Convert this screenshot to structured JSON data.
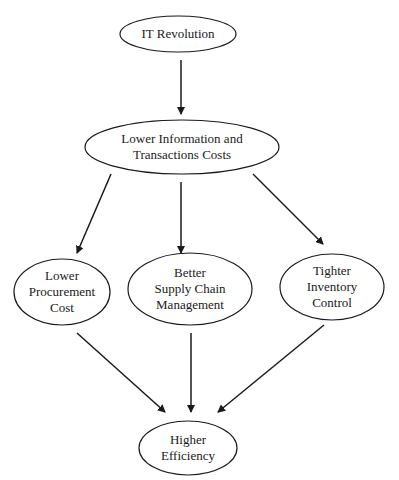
{
  "diagram": {
    "type": "flowchart",
    "stroke_color": "#1a1a1a",
    "background": "#ffffff",
    "nodes": [
      {
        "id": "it-revolution",
        "lines": [
          "IT Revolution"
        ],
        "cx": 178,
        "cy": 34,
        "rx": 58,
        "ry": 18
      },
      {
        "id": "lower-info-costs",
        "lines": [
          "Lower Information and",
          "Transactions Costs"
        ],
        "cx": 182,
        "cy": 147,
        "rx": 97,
        "ry": 27
      },
      {
        "id": "lower-procurement",
        "lines": [
          "Lower",
          "Procurement",
          "Cost"
        ],
        "cx": 62,
        "cy": 292,
        "rx": 48,
        "ry": 33
      },
      {
        "id": "better-supply-chain",
        "lines": [
          "Better",
          "Supply Chain",
          "Management"
        ],
        "cx": 190,
        "cy": 289,
        "rx": 62,
        "ry": 36
      },
      {
        "id": "tighter-inventory",
        "lines": [
          "Tighter",
          "Inventory",
          "Control"
        ],
        "cx": 332,
        "cy": 287,
        "rx": 52,
        "ry": 33
      },
      {
        "id": "higher-efficiency",
        "lines": [
          "Higher",
          "Efficiency"
        ],
        "cx": 188,
        "cy": 448,
        "rx": 49,
        "ry": 27
      }
    ],
    "edges": [
      {
        "from": "it-revolution",
        "to": "lower-info-costs",
        "x1": 181,
        "y1": 60,
        "x2": 181,
        "y2": 114
      },
      {
        "from": "lower-info-costs",
        "to": "lower-procurement",
        "x1": 111,
        "y1": 174,
        "x2": 77,
        "y2": 253
      },
      {
        "from": "lower-info-costs",
        "to": "better-supply-chain",
        "x1": 181,
        "y1": 182,
        "x2": 181,
        "y2": 253
      },
      {
        "from": "lower-info-costs",
        "to": "tighter-inventory",
        "x1": 253,
        "y1": 174,
        "x2": 323,
        "y2": 244
      },
      {
        "from": "lower-procurement",
        "to": "higher-efficiency",
        "x1": 77,
        "y1": 333,
        "x2": 165,
        "y2": 412
      },
      {
        "from": "better-supply-chain",
        "to": "higher-efficiency",
        "x1": 191,
        "y1": 333,
        "x2": 191,
        "y2": 412
      },
      {
        "from": "tighter-inventory",
        "to": "higher-efficiency",
        "x1": 324,
        "y1": 325,
        "x2": 218,
        "y2": 412
      }
    ]
  },
  "labels": {
    "n0": {
      "l0": "IT Revolution"
    },
    "n1": {
      "l0": "Lower Information and",
      "l1": "Transactions Costs"
    },
    "n2": {
      "l0": "Lower",
      "l1": "Procurement",
      "l2": "Cost"
    },
    "n3": {
      "l0": "Better",
      "l1": "Supply Chain",
      "l2": "Management"
    },
    "n4": {
      "l0": "Tighter",
      "l1": "Inventory",
      "l2": "Control"
    },
    "n5": {
      "l0": "Higher",
      "l1": "Efficiency"
    }
  }
}
